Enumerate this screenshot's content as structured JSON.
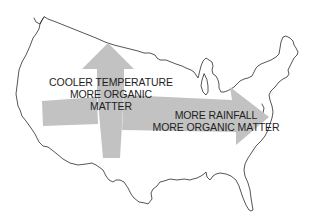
{
  "figure": {
    "type": "map-diagram",
    "region": "contiguous United States outline",
    "colors": {
      "background": "#ffffff",
      "outline": "#2a2a2a",
      "arrow_fill": "#c2c2c2",
      "text": "#1e1e1e"
    },
    "arrows": [
      {
        "direction": "north",
        "label_lines": [
          "COOLER TEMPERATURE",
          "MORE ORGANIC",
          "MATTER"
        ]
      },
      {
        "direction": "east",
        "label_lines": [
          "MORE RAINFALL",
          "MORE ORGANIC MATTER"
        ]
      }
    ]
  }
}
